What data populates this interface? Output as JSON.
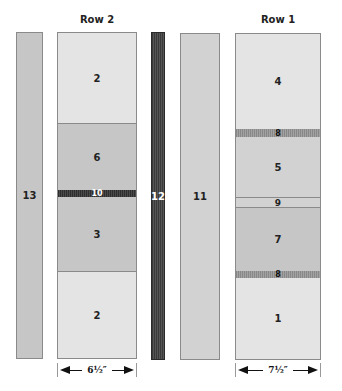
{
  "titles": {
    "row2": "Row 2",
    "row1": "Row 1"
  },
  "strips": {
    "s13": "13",
    "s12": "12",
    "s11": "11"
  },
  "row2": {
    "segments": [
      {
        "label": "2",
        "shade": "light"
      },
      {
        "label": "6",
        "shade": "mid"
      },
      {
        "label": "10",
        "shade": "dark-striped"
      },
      {
        "label": "3",
        "shade": "mid"
      },
      {
        "label": "2",
        "shade": "light"
      }
    ],
    "dimension": "6½″"
  },
  "row1": {
    "segments": [
      {
        "label": "4",
        "shade": "light"
      },
      {
        "label": "8",
        "shade": "striped"
      },
      {
        "label": "5",
        "shade": "midlight"
      },
      {
        "label": "9",
        "shade": "midlight"
      },
      {
        "label": "7",
        "shade": "mid"
      },
      {
        "label": "8",
        "shade": "striped"
      },
      {
        "label": "1",
        "shade": "light"
      }
    ],
    "dimension": "7½″"
  },
  "colors": {
    "light": "#e4e4e4",
    "mid": "#c6c6c6",
    "midlight": "#d2d2d2",
    "dark": "#3a3a3a",
    "border": "#8a8a8a"
  }
}
